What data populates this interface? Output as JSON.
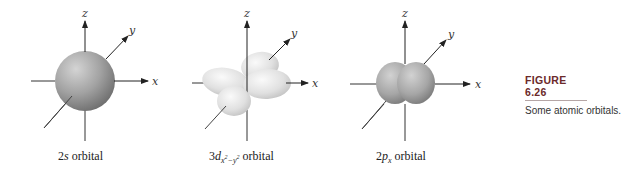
{
  "figure": {
    "number_label": "FIGURE 6.26",
    "caption": "Some atomic orbitals.",
    "colors": {
      "s_orbital": "#9a9a9a",
      "d_orbital": "#e2e2e2",
      "p_orbital": "#a4a4a4",
      "axis": "#333333",
      "caption_title": "#6b2a2a"
    }
  },
  "orbitals": [
    {
      "name": "2s",
      "label_prefix": "2",
      "label_italic": "s",
      "label_suffix": " orbital",
      "axes": {
        "x": "x",
        "y": "y",
        "z": "z"
      }
    },
    {
      "name": "3d(x2-y2)",
      "label_prefix": "3",
      "label_italic": "d",
      "label_sub": "x",
      "label_sub_sup1": "2",
      "label_sub_mid": "−y",
      "label_sub_sup2": "2",
      "label_suffix": " orbital",
      "axes": {
        "x": "x",
        "y": "y",
        "z": "z"
      }
    },
    {
      "name": "2px",
      "label_prefix": "2",
      "label_italic": "p",
      "label_sub": "x",
      "label_suffix": " orbital",
      "axes": {
        "x": "x",
        "y": "y",
        "z": "z"
      }
    }
  ]
}
